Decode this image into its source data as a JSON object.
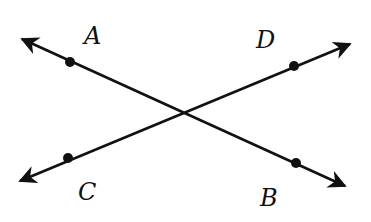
{
  "diagram": {
    "labels": {
      "A": "A",
      "B": "B",
      "C": "C",
      "D": "D"
    },
    "lines": [
      {
        "name": "AB",
        "from": [
          22,
          39
        ],
        "to": [
          345,
          186
        ]
      },
      {
        "name": "CD",
        "from": [
          20,
          181
        ],
        "to": [
          350,
          44
        ]
      }
    ],
    "points": {
      "A": [
        70,
        62
      ],
      "B": [
        296,
        163
      ],
      "C": [
        68,
        158
      ],
      "D": [
        294,
        66
      ]
    },
    "color": "#111111"
  }
}
